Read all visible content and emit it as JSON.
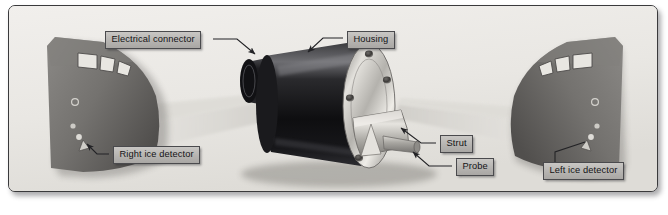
{
  "figure": {
    "background_color": "#eceae6",
    "border_color": "#3a3a3c",
    "label_fill": "#bdbbb8",
    "label_text_color": "#141416",
    "housing_color": "#1b1b1d",
    "flange_color": "#b9b7b2",
    "fuselage_color": "#6f6d6b",
    "beam_color": "#d6d4cf"
  },
  "labels": {
    "electrical_connector": "Electrical connector",
    "housing": "Housing",
    "right_ice_detector": "Right ice detector",
    "strut": "Strut",
    "probe": "Probe",
    "left_ice_detector": "Left ice detector"
  },
  "components": {
    "housing_name": "ice-detector-housing",
    "connector_name": "electrical-connector-stub",
    "flange_name": "mounting-flange",
    "strut_name": "strut-blade",
    "probe_name": "probe-rod",
    "bolt_count": 5
  },
  "aircraft": {
    "left_nose_name": "right-ice-detector-aircraft-nose",
    "right_nose_name": "left-ice-detector-aircraft-nose",
    "cockpit_window_count": 3,
    "detector_marker_count": 3
  },
  "ghost_text": {
    "lines": [
      "system",
      "detector",
      "the aircraft",
      "ice accretion",
      "probe",
      "signal"
    ]
  }
}
